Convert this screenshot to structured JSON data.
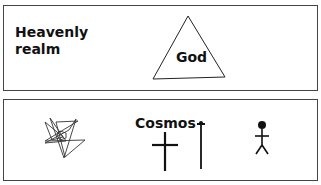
{
  "upper_panel": {
    "title": "Heavenly realm",
    "symbol": {
      "name": "triangle",
      "label": "God"
    }
  },
  "lower_panel": {
    "title": "Cosmos",
    "symbols": [
      {
        "name": "inverted-pentagram"
      },
      {
        "name": "cross"
      },
      {
        "name": "nail"
      },
      {
        "name": "stick-figure-human"
      }
    ]
  },
  "colors": {
    "line": "#111111",
    "border": "#444444",
    "background": "#ffffff"
  }
}
